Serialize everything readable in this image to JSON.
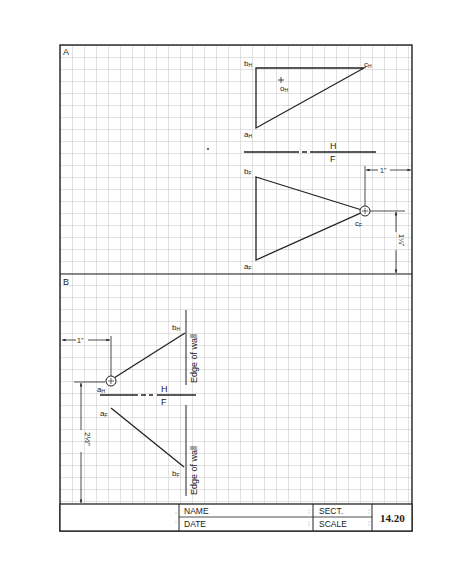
{
  "sheet": {
    "paper_color": "#ffffff",
    "grid_color": "#b8b8b8",
    "ink_color": "#222222",
    "grid_spacing_px": 12
  },
  "panel_a": {
    "label": "A",
    "points": {
      "bH": {
        "label": "b",
        "sub": "H"
      },
      "cH": {
        "label": "c",
        "sub": "H"
      },
      "oH": {
        "label": "o",
        "sub": "H"
      },
      "aH": {
        "label": "a",
        "sub": "H"
      },
      "bF": {
        "label": "b",
        "sub": "F"
      },
      "cF": {
        "label": "c",
        "sub": "F"
      },
      "aF": {
        "label": "a",
        "sub": "F"
      }
    },
    "fold_line": {
      "top": "H",
      "bottom": "F"
    },
    "dim_horizontal": "1\"",
    "dim_vertical": "1¼\""
  },
  "panel_b": {
    "label": "B",
    "points": {
      "bH": {
        "label": "b",
        "sub": "H"
      },
      "aH": {
        "label": "a",
        "sub": "H"
      },
      "aF": {
        "label": "a",
        "sub": "F"
      },
      "bF": {
        "label": "b",
        "sub": "F"
      }
    },
    "fold_line": {
      "top": "H",
      "bottom": "F"
    },
    "wall_label_top": "Edge of wall",
    "wall_label_bottom": "Edge of wall",
    "dim_horizontal": "1\"",
    "dim_vertical": "2½\""
  },
  "title_block": {
    "name_label": "NAME",
    "date_label": "DATE",
    "sect_label": "SECT.",
    "scale_label": "SCALE",
    "sheet_number": "14.20"
  }
}
